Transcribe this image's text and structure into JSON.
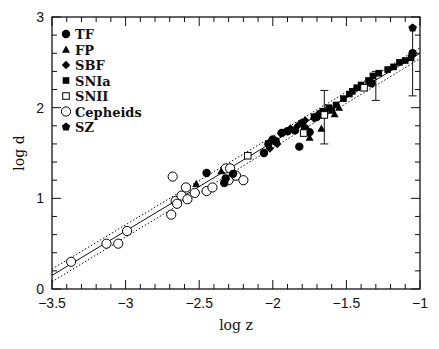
{
  "chart_data": {
    "type": "scatter",
    "title": "",
    "xlabel": "log z",
    "ylabel": "log d",
    "xlim": [
      -3.5,
      -1
    ],
    "ylim": [
      0,
      3
    ],
    "x_ticks": [
      -3.5,
      -3,
      -2.5,
      -2,
      -1.5,
      -1
    ],
    "x_tick_labels": [
      "−3.5",
      "−3",
      "−2.5",
      "−2",
      "−1.5",
      "−1"
    ],
    "y_ticks": [
      0,
      1,
      2,
      3
    ],
    "y_tick_labels": [
      "0",
      "1",
      "2",
      "3"
    ],
    "grid": false,
    "legend_position": "upper-left",
    "legend": [
      {
        "name": "TF",
        "marker": "filled-circle"
      },
      {
        "name": "FP",
        "marker": "filled-triangle"
      },
      {
        "name": "SBF",
        "marker": "filled-diamond"
      },
      {
        "name": "SNIa",
        "marker": "filled-square"
      },
      {
        "name": "SNII",
        "marker": "open-square"
      },
      {
        "name": "Cepheids",
        "marker": "open-circle"
      },
      {
        "name": "SZ",
        "marker": "filled-pentagon"
      }
    ],
    "fit_line": {
      "x": [
        -3.5,
        -1
      ],
      "y": [
        0.15,
        2.6
      ],
      "style": "solid"
    },
    "fit_bands": [
      {
        "x": [
          -3.5,
          -1
        ],
        "y": [
          0.22,
          2.66
        ],
        "style": "dotted"
      },
      {
        "x": [
          -3.5,
          -1
        ],
        "y": [
          0.08,
          2.54
        ],
        "style": "dotted"
      }
    ],
    "series": [
      {
        "name": "Cepheids",
        "marker": "open-circle",
        "points": [
          [
            -3.37,
            0.3
          ],
          [
            -3.13,
            0.5
          ],
          [
            -3.05,
            0.5
          ],
          [
            -2.99,
            0.64
          ],
          [
            -2.69,
            0.82
          ],
          [
            -2.68,
            1.24
          ],
          [
            -2.66,
            0.97
          ],
          [
            -2.65,
            0.94
          ],
          [
            -2.62,
            1.03
          ],
          [
            -2.59,
            1.12
          ],
          [
            -2.58,
            0.99
          ],
          [
            -2.53,
            1.06
          ],
          [
            -2.45,
            1.08
          ],
          [
            -2.41,
            1.12
          ],
          [
            -2.32,
            1.33
          ],
          [
            -2.3,
            1.2
          ],
          [
            -2.29,
            1.33
          ],
          [
            -2.25,
            1.25
          ],
          [
            -2.2,
            1.2
          ]
        ]
      },
      {
        "name": "TF",
        "marker": "filled-circle",
        "points": [
          [
            -2.45,
            1.28
          ],
          [
            -2.33,
            1.17
          ],
          [
            -2.32,
            1.22
          ],
          [
            -2.27,
            1.27
          ],
          [
            -2.06,
            1.5
          ],
          [
            -2.03,
            1.6
          ],
          [
            -2.0,
            1.65
          ],
          [
            -1.98,
            1.63
          ],
          [
            -1.94,
            1.72
          ],
          [
            -1.9,
            1.74
          ],
          [
            -1.85,
            1.75
          ],
          [
            -1.82,
            1.57
          ],
          [
            -1.8,
            1.83
          ],
          [
            -1.78,
            1.77
          ],
          [
            -1.75,
            1.73
          ],
          [
            -1.7,
            1.9
          ],
          [
            -1.68,
            1.93
          ],
          [
            -1.65,
            1.95
          ],
          [
            -1.33,
            2.27
          ],
          [
            -1.05,
            2.6
          ]
        ]
      },
      {
        "name": "FP",
        "marker": "filled-triangle",
        "points": [
          [
            -2.52,
            1.16
          ],
          [
            -2.35,
            1.3
          ],
          [
            -1.75,
            1.67
          ],
          [
            -1.67,
            1.77
          ],
          [
            -1.58,
            1.93
          ],
          [
            -1.55,
            2.0
          ]
        ]
      },
      {
        "name": "SBF",
        "marker": "filled-diamond",
        "points": [
          [
            -2.02,
            1.55
          ],
          [
            -1.97,
            1.6
          ],
          [
            -1.88,
            1.77
          ],
          [
            -1.83,
            1.8
          ],
          [
            -1.78,
            1.86
          ],
          [
            -1.72,
            1.88
          ]
        ]
      },
      {
        "name": "SNIa",
        "marker": "filled-square",
        "points": [
          [
            -1.72,
            1.9
          ],
          [
            -1.66,
            1.96
          ],
          [
            -1.62,
            2.0
          ],
          [
            -1.6,
            1.97
          ],
          [
            -1.57,
            2.03
          ],
          [
            -1.52,
            2.1
          ],
          [
            -1.48,
            2.15
          ],
          [
            -1.46,
            2.18
          ],
          [
            -1.43,
            2.22
          ],
          [
            -1.4,
            2.25
          ],
          [
            -1.35,
            2.3
          ],
          [
            -1.32,
            2.35
          ],
          [
            -1.28,
            2.38
          ],
          [
            -1.22,
            2.42
          ],
          [
            -1.18,
            2.45
          ],
          [
            -1.14,
            2.5
          ],
          [
            -1.1,
            2.52
          ],
          [
            -1.06,
            2.55
          ]
        ]
      },
      {
        "name": "SNII",
        "marker": "open-square",
        "points": [
          [
            -2.17,
            1.47
          ],
          [
            -1.79,
            1.72
          ],
          [
            -1.65,
            1.92
          ],
          [
            -1.38,
            2.22
          ]
        ]
      },
      {
        "name": "SZ",
        "marker": "filled-pentagon",
        "points": [
          [
            -1.05,
            2.88
          ]
        ]
      }
    ],
    "error_bars": [
      {
        "x": -1.65,
        "y": 1.93,
        "ylow": 1.6,
        "yhigh": 2.19
      },
      {
        "x": -1.3,
        "y": 2.27,
        "ylow": 2.08,
        "yhigh": 2.4
      },
      {
        "x": -1.05,
        "y": 2.6,
        "ylow": 2.13,
        "yhigh": 2.88
      }
    ]
  }
}
